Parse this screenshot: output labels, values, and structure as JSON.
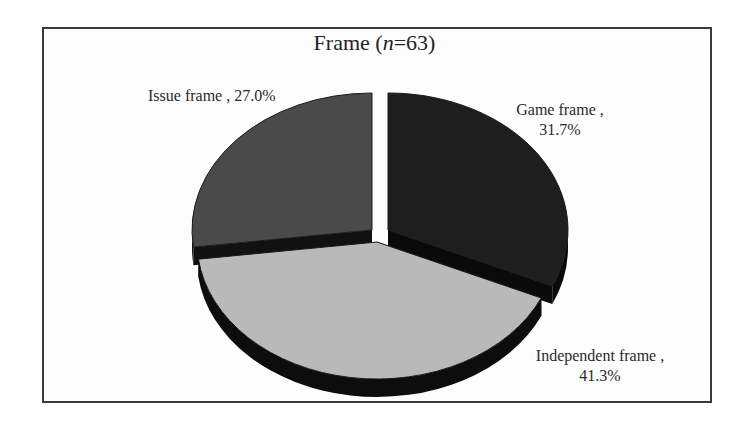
{
  "chart_data": {
    "type": "pie",
    "title": "Frame (n=63)",
    "title_parts": {
      "prefix": "Frame (",
      "italic": "n",
      "suffix": "=63)"
    },
    "n": 63,
    "style": "3d-exploded",
    "slices": [
      {
        "name": "Game frame",
        "value": 31.7,
        "label_line1": "Game frame ,",
        "label_line2": "31.7%",
        "color": "#1e1e1e",
        "side_color": "#0a0a0a"
      },
      {
        "name": "Independent frame",
        "value": 41.3,
        "label_line1": "Independent frame ,",
        "label_line2": "41.3%",
        "color": "#b9b9b9",
        "side_color": "#0d0d0d"
      },
      {
        "name": "Issue frame",
        "value": 27.0,
        "label_line1": "Issue frame , 27.0%",
        "label_line2": "",
        "color": "#4a4a4a",
        "side_color": "#111111"
      }
    ],
    "legend": "none (inline labels)",
    "unit": "%"
  }
}
